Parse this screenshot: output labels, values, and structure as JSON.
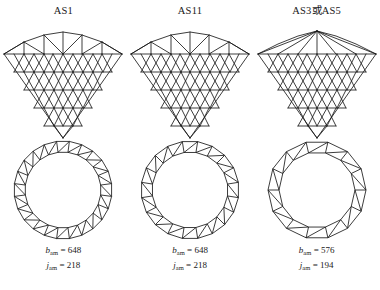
{
  "figure": {
    "background_color": "#ffffff",
    "line_color": "#1a1a1a",
    "columns": [
      {
        "title": "AS1",
        "elevation": {
          "name": "lattice-dome-elevation-as1",
          "rings": 5,
          "top_arc_segments": 6,
          "apex_style": "arched-crown"
        },
        "plan": {
          "name": "ring-truss-plan-as1",
          "outer_polygon_sides": 24,
          "inner_polygon_sides": 24,
          "bracing": "zigzag"
        },
        "members_symbol": "b",
        "members_subscript": "am",
        "members_value": "648",
        "joints_symbol": "j",
        "joints_subscript": "am",
        "joints_value": "218",
        "equals": "="
      },
      {
        "title": "AS11",
        "elevation": {
          "name": "lattice-dome-elevation-as11",
          "rings": 5,
          "top_arc_segments": 6,
          "apex_style": "arched-crown"
        },
        "plan": {
          "name": "ring-truss-plan-as11",
          "outer_polygon_sides": 20,
          "inner_polygon_sides": 20,
          "bracing": "trapezoid-diagonal"
        },
        "members_symbol": "b",
        "members_subscript": "am",
        "members_value": "648",
        "joints_symbol": "j",
        "joints_subscript": "am",
        "joints_value": "218",
        "equals": "="
      },
      {
        "title": "AS3或AS5",
        "elevation": {
          "name": "lattice-dome-elevation-as3-as5",
          "rings": 5,
          "top_arc_segments": 6,
          "apex_style": "radiating-ribs"
        },
        "plan": {
          "name": "ring-truss-plan-as3-as5",
          "outer_polygon_sides": 14,
          "inner_polygon_sides": 14,
          "bracing": "coarse-diagonal"
        },
        "members_symbol": "b",
        "members_subscript": "am",
        "members_value": "576",
        "joints_symbol": "j",
        "joints_subscript": "am",
        "joints_value": "194",
        "equals": "="
      }
    ]
  }
}
